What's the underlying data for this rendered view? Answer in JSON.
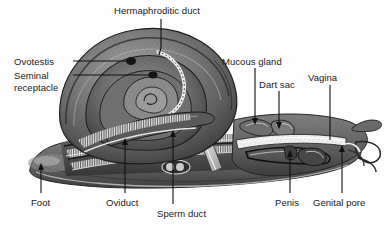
{
  "figure": {
    "type": "labeled anatomical illustration",
    "width": 384,
    "height": 225,
    "background_color": "#fdfdfd",
    "art_style": "grayscale engraving / halftone cutaway",
    "text_color": "#1b1b1b",
    "leader_color": "#111111"
  },
  "labels": [
    {
      "id": "hermaphroditic-duct",
      "text": "Hermaphroditic duct",
      "x": 114,
      "y": 5,
      "align": "left"
    },
    {
      "id": "ovotestis",
      "text": "Ovotestis",
      "x": 14,
      "y": 56,
      "align": "left"
    },
    {
      "id": "seminal-receptacle",
      "text": "Seminal receptacle",
      "x": 14,
      "y": 70,
      "align": "left",
      "lines": [
        "Seminal",
        "receptacle"
      ]
    },
    {
      "id": "mucous-gland",
      "text": "Mucous gland",
      "x": 222,
      "y": 56,
      "align": "left"
    },
    {
      "id": "dart-sac",
      "text": "Dart sac",
      "x": 259,
      "y": 79,
      "align": "left"
    },
    {
      "id": "vagina",
      "text": "Vagina",
      "x": 308,
      "y": 72,
      "align": "left"
    },
    {
      "id": "foot",
      "text": "Foot",
      "x": 31,
      "y": 197,
      "align": "left"
    },
    {
      "id": "oviduct",
      "text": "Oviduct",
      "x": 106,
      "y": 197,
      "align": "left"
    },
    {
      "id": "sperm-duct",
      "text": "Sperm duct",
      "x": 157,
      "y": 208,
      "align": "left"
    },
    {
      "id": "penis",
      "text": "Penis",
      "x": 275,
      "y": 197,
      "align": "left"
    },
    {
      "id": "genital-pore",
      "text": "Genital pore",
      "x": 313,
      "y": 197,
      "align": "left"
    }
  ],
  "leaders": [
    {
      "id": "leader-hermaphroditic-duct",
      "points": "161,19 161,48 159,54",
      "arrow": false
    },
    {
      "id": "leader-ovotestis",
      "points": "73,61 130,61",
      "arrow": false
    },
    {
      "id": "leader-seminal-receptacle",
      "points": "73,75 152,75",
      "arrow": false
    },
    {
      "id": "leader-mucous-gland",
      "points": "255,68 255,120",
      "arrow": true
    },
    {
      "id": "leader-dart-sac",
      "points": "279,91 279,124",
      "arrow": true
    },
    {
      "id": "leader-vagina",
      "points": "330,85 330,139",
      "arrow": false
    },
    {
      "id": "leader-foot",
      "points": "41,193 41,168",
      "arrow": true
    },
    {
      "id": "leader-oviduct",
      "points": "125,193 125,143",
      "arrow": true
    },
    {
      "id": "leader-sperm-duct",
      "points": "173,204 173,135",
      "arrow": true
    },
    {
      "id": "leader-penis",
      "points": "290,193 290,155",
      "arrow": true
    },
    {
      "id": "leader-genital-pore",
      "points": "342,193 342,150",
      "arrow": true
    }
  ]
}
